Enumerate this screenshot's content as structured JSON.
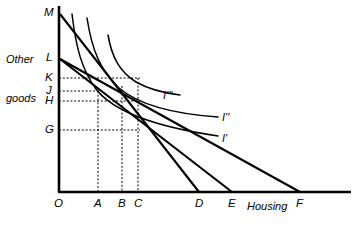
{
  "figure": {
    "type": "economics-indifference-curve-diagram",
    "background_color": "#ffffff",
    "line_color": "#000000",
    "axes": {
      "y_axis_label": "Other\ngoods",
      "y_axis_label_line1": "Other",
      "y_axis_label_line2": "goods",
      "x_axis_label": "Housing",
      "origin_label": "O"
    },
    "y_axis_ticks": [
      {
        "label": "M",
        "y_px": 13
      },
      {
        "label": "L",
        "y_px": 58
      },
      {
        "label": "K",
        "y_px": 78
      },
      {
        "label": "J",
        "y_px": 91
      },
      {
        "label": "H",
        "y_px": 101
      },
      {
        "label": "G",
        "y_px": 130
      }
    ],
    "x_axis_ticks": [
      {
        "label": "O",
        "x_px": 58
      },
      {
        "label": "A",
        "x_px": 98
      },
      {
        "label": "B",
        "x_px": 122
      },
      {
        "label": "C",
        "x_px": 138
      },
      {
        "label": "D",
        "x_px": 199
      },
      {
        "label": "E",
        "x_px": 232
      },
      {
        "label": "F",
        "x_px": 300
      }
    ],
    "curve_labels": [
      {
        "label": "I'''",
        "x_px": 163,
        "y_px": 95
      },
      {
        "label": "I''",
        "x_px": 222,
        "y_px": 118
      },
      {
        "label": "I'",
        "x_px": 222,
        "y_px": 139
      }
    ],
    "budget_lines": [
      {
        "name": "MD",
        "from": "M",
        "to": "D"
      },
      {
        "name": "LE",
        "from": "L",
        "to": "E"
      },
      {
        "name": "LF",
        "from": "L",
        "to": "F"
      }
    ],
    "tangency_points": [
      {
        "budget_line": "LF",
        "quantity": "A",
        "other_goods": "J"
      },
      {
        "budget_line": "LE",
        "quantity": "B",
        "other_goods": "H"
      },
      {
        "budget_line": "MD",
        "quantity": "C",
        "other_goods": "K"
      },
      {
        "budget_line": "reference",
        "quantity": "C",
        "other_goods": "G"
      }
    ]
  }
}
